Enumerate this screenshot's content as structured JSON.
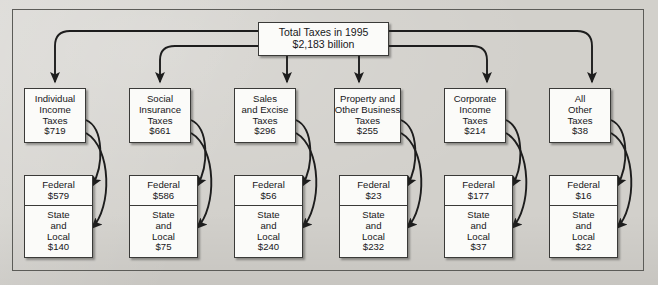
{
  "diagram": {
    "root": {
      "line1": "Total Taxes in 1995",
      "line2": "$2,183 billion"
    },
    "columns": [
      {
        "category_lines": [
          "Individual",
          "Income",
          "Taxes",
          "$719"
        ],
        "federal_lines": [
          "Federal",
          "$579"
        ],
        "state_local_lines": [
          "State",
          "and",
          "Local",
          "$140"
        ]
      },
      {
        "category_lines": [
          "Social",
          "Insurance",
          "Taxes",
          "$661"
        ],
        "federal_lines": [
          "Federal",
          "$586"
        ],
        "state_local_lines": [
          "State",
          "and",
          "Local",
          "$75"
        ]
      },
      {
        "category_lines": [
          "Sales",
          "and Excise",
          "Taxes",
          "$296"
        ],
        "federal_lines": [
          "Federal",
          "$56"
        ],
        "state_local_lines": [
          "State",
          "and",
          "Local",
          "$240"
        ]
      },
      {
        "category_lines": [
          "Property and",
          "Other Business",
          "Taxes",
          "$255"
        ],
        "federal_lines": [
          "Federal",
          "$23"
        ],
        "state_local_lines": [
          "State",
          "and",
          "Local",
          "$232"
        ]
      },
      {
        "category_lines": [
          "Corporate",
          "Income",
          "Taxes",
          "$214"
        ],
        "federal_lines": [
          "Federal",
          "$177"
        ],
        "state_local_lines": [
          "State",
          "and",
          "Local",
          "$37"
        ]
      },
      {
        "category_lines": [
          "All",
          "Other",
          "Taxes",
          "$38"
        ],
        "federal_lines": [
          "Federal",
          "$16"
        ],
        "state_local_lines": [
          "State",
          "and",
          "Local",
          "$22"
        ]
      }
    ],
    "colors": {
      "background": "#d2d0cb",
      "box_fill": "#fbfbf9",
      "box_border": "#3a3a38",
      "connector": "#1d1d1d",
      "frame_border": "#5c5c58"
    }
  }
}
